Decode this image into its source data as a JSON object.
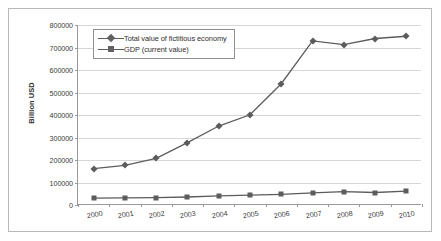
{
  "chart_data": {
    "type": "line",
    "title": "",
    "xlabel": "",
    "ylabel": "Billion USD",
    "categories": [
      "2000",
      "2001",
      "2002",
      "2003",
      "2004",
      "2005",
      "2006",
      "2007",
      "2008",
      "2009",
      "2010"
    ],
    "ylim": [
      0,
      800000
    ],
    "ytick_values": [
      0,
      100000,
      200000,
      300000,
      400000,
      500000,
      600000,
      700000,
      800000
    ],
    "ytick_labels": [
      "0",
      "100000",
      "200000",
      "300000",
      "400000",
      "500000",
      "600000",
      "700000",
      "800000"
    ],
    "grid": true,
    "legend_position": "top-left-inside",
    "series": [
      {
        "name": "Total value of fictitious economy",
        "marker": "diamond",
        "color": "#5c5c5c",
        "values": [
          162000,
          176000,
          207000,
          277000,
          351000,
          401000,
          539000,
          729000,
          713000,
          740000,
          750000
        ]
      },
      {
        "name": "GDP (current value)",
        "marker": "square",
        "color": "#5c5c5c",
        "values": [
          31000,
          31500,
          32500,
          35500,
          40500,
          43500,
          47500,
          54000,
          59500,
          55500,
          62000
        ]
      }
    ]
  },
  "axis": {
    "y_title": "Billion USD"
  },
  "legend": {
    "items": [
      {
        "label": "Total value of fictitious economy",
        "marker": "diamond"
      },
      {
        "label": "GDP (current value)",
        "marker": "square"
      }
    ]
  }
}
